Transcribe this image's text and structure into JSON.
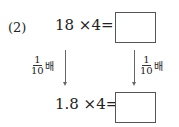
{
  "problem": {
    "label": "(2)",
    "top_equation": "18 ×4=",
    "bottom_equation": "1.8 ×4=",
    "left_ratio": {
      "numerator": "1",
      "denominator": "10",
      "unit": "배"
    },
    "right_ratio": {
      "numerator": "1",
      "denominator": "10",
      "unit": "배"
    },
    "top_answer": "",
    "bottom_answer": ""
  }
}
